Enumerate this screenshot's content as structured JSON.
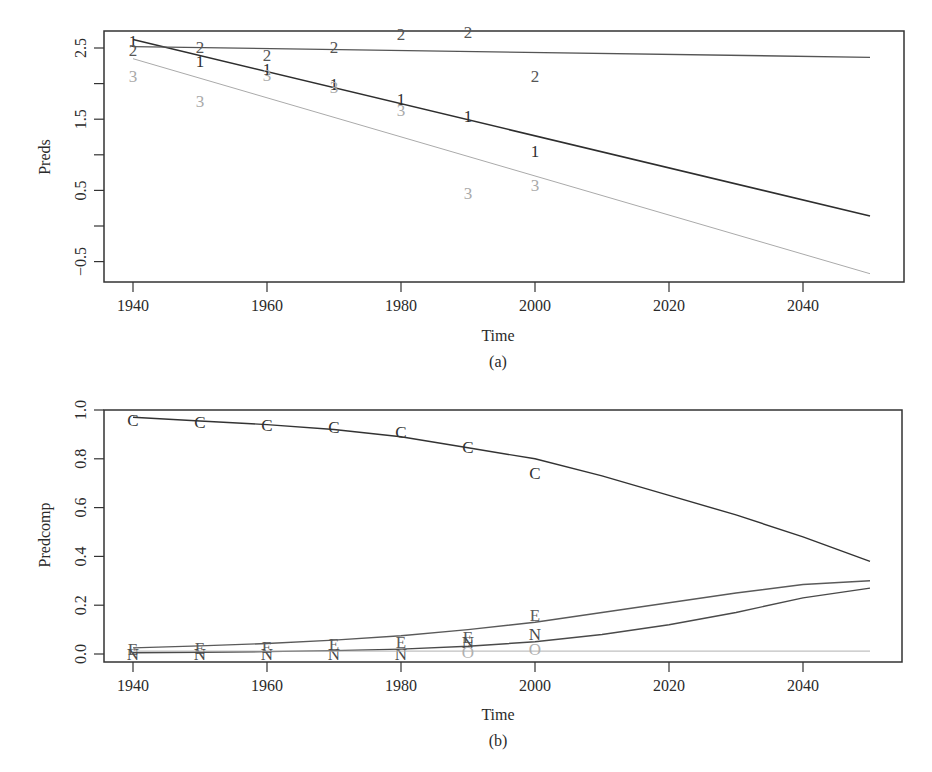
{
  "colors": {
    "series1": "#2e2e2e",
    "series2": "#555555",
    "series3": "#aaaaaa",
    "seriesC": "#333333",
    "seriesE": "#5a5a5a",
    "seriesN": "#4a4a4a",
    "seriesO": "#b0b0b0",
    "axis": "#333333"
  },
  "chart_data": [
    {
      "id": "a",
      "type": "line",
      "caption": "(a)",
      "xlabel": "Time",
      "ylabel": "Preds",
      "xlim": [
        1936,
        2055
      ],
      "ylim": [
        -0.75,
        2.85
      ],
      "xticks": [
        1940,
        1960,
        1980,
        2000,
        2020,
        2040
      ],
      "yticks": [
        -0.5,
        0,
        0.5,
        1,
        1.5,
        2,
        2.5
      ],
      "ytick_labels": [
        "-0.5",
        "",
        "0.5",
        "",
        "1.5",
        "",
        "2.5"
      ],
      "grid": false,
      "legend": "none (series identified by plotting characters 1, 2, 3)",
      "series": [
        {
          "name": "1",
          "line": {
            "x": [
              1940,
              2050
            ],
            "y": [
              2.62,
              0.14
            ]
          },
          "points": {
            "x": [
              1940,
              1950,
              1960,
              1970,
              1980,
              1990,
              2000
            ],
            "y": [
              2.6,
              2.32,
              2.2,
              2.0,
              1.78,
              1.55,
              1.05
            ]
          }
        },
        {
          "name": "2",
          "line": {
            "x": [
              1940,
              2050
            ],
            "y": [
              2.52,
              2.37
            ]
          },
          "points": {
            "x": [
              1940,
              1950,
              1960,
              1970,
              1980,
              1990,
              2000
            ],
            "y": [
              2.47,
              2.52,
              2.4,
              2.52,
              2.7,
              2.72,
              2.1
            ]
          }
        },
        {
          "name": "3",
          "line": {
            "x": [
              1940,
              2050
            ],
            "y": [
              2.35,
              -0.67
            ]
          },
          "points": {
            "x": [
              1940,
              1950,
              1960,
              1970,
              1980,
              1990,
              2000
            ],
            "y": [
              2.1,
              1.75,
              2.12,
              1.95,
              1.63,
              0.47,
              0.57
            ]
          }
        }
      ]
    },
    {
      "id": "b",
      "type": "line",
      "caption": "(b)",
      "xlabel": "Time",
      "ylabel": "Predcomp",
      "xlim": [
        1936,
        2055
      ],
      "ylim": [
        -0.03,
        1.0
      ],
      "xticks": [
        1940,
        1960,
        1980,
        2000,
        2020,
        2040
      ],
      "yticks": [
        0.0,
        0.2,
        0.4,
        0.6,
        0.8,
        1.0
      ],
      "ytick_labels": [
        "0.0",
        "0.2",
        "0.4",
        "0.6",
        "0.8",
        "1.0"
      ],
      "grid": false,
      "legend": "none (series identified by plotting characters C, E, N, O)",
      "series": [
        {
          "name": "C",
          "line": {
            "x": [
              1940,
              1950,
              1960,
              1970,
              1980,
              1990,
              2000,
              2010,
              2020,
              2030,
              2040,
              2050
            ],
            "y": [
              0.97,
              0.955,
              0.94,
              0.92,
              0.89,
              0.845,
              0.8,
              0.73,
              0.65,
              0.57,
              0.48,
              0.38
            ]
          },
          "points": {
            "x": [
              1940,
              1950,
              1960,
              1970,
              1980,
              1990,
              2000
            ],
            "y": [
              0.96,
              0.95,
              0.94,
              0.93,
              0.91,
              0.85,
              0.74
            ]
          }
        },
        {
          "name": "E",
          "line": {
            "x": [
              1940,
              1950,
              1960,
              1970,
              1980,
              1990,
              2000,
              2010,
              2020,
              2030,
              2040,
              2050
            ],
            "y": [
              0.025,
              0.033,
              0.043,
              0.057,
              0.075,
              0.1,
              0.13,
              0.17,
              0.21,
              0.25,
              0.285,
              0.3
            ]
          },
          "points": {
            "x": [
              1940,
              1950,
              1960,
              1970,
              1980,
              1990,
              2000
            ],
            "y": [
              0.02,
              0.025,
              0.03,
              0.04,
              0.05,
              0.07,
              0.16
            ]
          }
        },
        {
          "name": "N",
          "line": {
            "x": [
              1940,
              1950,
              1960,
              1970,
              1980,
              1990,
              2000,
              2010,
              2020,
              2030,
              2040,
              2050
            ],
            "y": [
              0.005,
              0.007,
              0.01,
              0.014,
              0.02,
              0.032,
              0.05,
              0.08,
              0.12,
              0.17,
              0.23,
              0.27
            ]
          },
          "points": {
            "x": [
              1940,
              1950,
              1960,
              1970,
              1980,
              1990,
              2000
            ],
            "y": [
              0.0,
              0.0,
              0.0,
              0.0,
              0.0,
              0.05,
              0.08
            ]
          }
        },
        {
          "name": "O",
          "line": {
            "x": [
              1940,
              2050
            ],
            "y": [
              0.012,
              0.012
            ]
          },
          "points": {
            "x": [
              1990,
              2000
            ],
            "y": [
              0.01,
              0.02
            ]
          }
        }
      ]
    }
  ]
}
